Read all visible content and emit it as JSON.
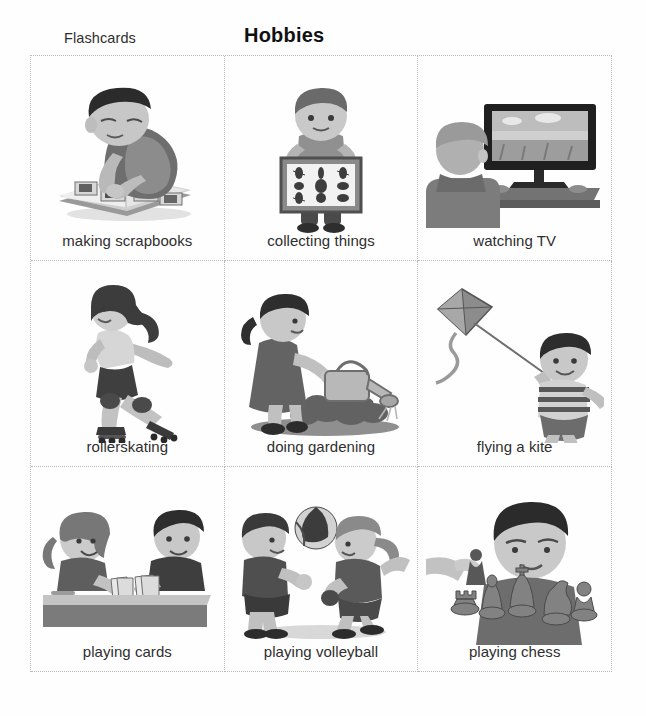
{
  "header": {
    "left_label": "Flashcards",
    "title": "Hobbies"
  },
  "grid": {
    "columns": 3,
    "rows": 3,
    "cards": [
      {
        "label": "making scrapbooks",
        "illustration": "boy-scrapbook-illustration"
      },
      {
        "label": "collecting things",
        "illustration": "boy-insect-collection-illustration"
      },
      {
        "label": "watching TV",
        "illustration": "person-watching-television-illustration"
      },
      {
        "label": "rollerskating",
        "illustration": "girl-rollerskating-illustration"
      },
      {
        "label": "doing gardening",
        "illustration": "girl-watering-plants-illustration"
      },
      {
        "label": "flying a kite",
        "illustration": "boy-flying-kite-illustration"
      },
      {
        "label": "playing cards",
        "illustration": "two-children-playing-cards-illustration"
      },
      {
        "label": "playing volleyball",
        "illustration": "two-children-volleyball-illustration"
      },
      {
        "label": "playing chess",
        "illustration": "boy-playing-chess-illustration"
      }
    ]
  },
  "colors": {
    "page_background": "#fefefe",
    "grid_line": "#b9b9b9",
    "title_text": "#111111",
    "label_text": "#2e2e2e",
    "art_dark": "#3a3a3a",
    "art_mid": "#8d8d8d",
    "art_light": "#c9c9c9"
  }
}
